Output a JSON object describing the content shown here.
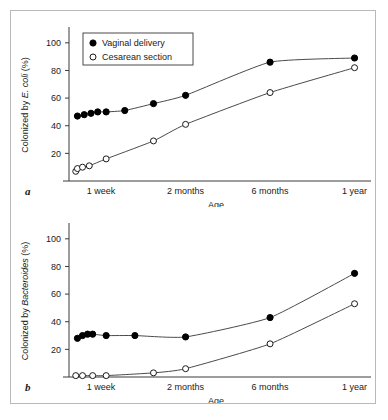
{
  "figure": {
    "panels": [
      {
        "tag": "a",
        "ylabel_prefix": "Colonized by ",
        "ylabel_italic": "E. coli",
        "ylabel_suffix": " (%)",
        "xlabel": "Age"
      },
      {
        "tag": "b",
        "ylabel_prefix": "Colonized by ",
        "ylabel_italic": "Bacteroides",
        "ylabel_suffix": " (%)",
        "xlabel": "Age"
      }
    ],
    "legend": {
      "entries": [
        {
          "label": "Vaginal delivery",
          "marker": "filled-circle-icon"
        },
        {
          "label": "Cesarean section",
          "marker": "open-circle-icon"
        }
      ]
    }
  },
  "chart_data": [
    {
      "type": "line",
      "title": "",
      "panel": "a",
      "xlabel": "Age",
      "ylabel": "Colonized by E. coli (%)",
      "x_tick_labels": [
        "1 week",
        "2 months",
        "6 months",
        "1 year"
      ],
      "x_tick_positions": [
        1.0,
        2.0,
        3.0,
        4.0
      ],
      "y_tick_labels": [
        "20",
        "40",
        "60",
        "80",
        "100"
      ],
      "ylim": [
        0,
        110
      ],
      "xlim": [
        0.62,
        4.1
      ],
      "grid": false,
      "legend_position": "top-left",
      "series": [
        {
          "name": "Vaginal delivery",
          "marker": "filled-circle",
          "x": [
            0.72,
            0.8,
            0.88,
            0.96,
            1.06,
            1.28,
            1.62,
            2.0,
            3.0,
            4.0
          ],
          "values": [
            47,
            48,
            49,
            50,
            50,
            51,
            56,
            62,
            86,
            89
          ]
        },
        {
          "name": "Cesarean section",
          "marker": "open-circle",
          "x": [
            0.7,
            0.72,
            0.78,
            0.86,
            1.06,
            1.62,
            2.0,
            3.0,
            4.0
          ],
          "values": [
            7,
            9,
            10,
            11,
            16,
            29,
            41,
            64,
            82
          ]
        }
      ]
    },
    {
      "type": "line",
      "title": "",
      "panel": "b",
      "xlabel": "Age",
      "ylabel": "Colonized by Bacteroides (%)",
      "x_tick_labels": [
        "1 week",
        "2 months",
        "6 months",
        "1 year"
      ],
      "x_tick_positions": [
        1.0,
        2.0,
        3.0,
        4.0
      ],
      "y_tick_labels": [
        "20",
        "40",
        "60",
        "80",
        "100"
      ],
      "ylim": [
        0,
        110
      ],
      "xlim": [
        0.62,
        4.1
      ],
      "grid": false,
      "legend_position": "none",
      "series": [
        {
          "name": "Vaginal delivery",
          "marker": "filled-circle",
          "x": [
            0.72,
            0.78,
            0.84,
            0.9,
            1.06,
            1.4,
            2.0,
            3.0,
            4.0
          ],
          "values": [
            28,
            30,
            31,
            31,
            30,
            30,
            29,
            43,
            75
          ]
        },
        {
          "name": "Cesarean section",
          "marker": "open-circle",
          "x": [
            0.7,
            0.78,
            0.9,
            1.06,
            1.62,
            2.0,
            3.0,
            4.0
          ],
          "values": [
            1,
            1,
            1,
            1,
            3,
            6,
            24,
            53
          ]
        }
      ]
    }
  ]
}
